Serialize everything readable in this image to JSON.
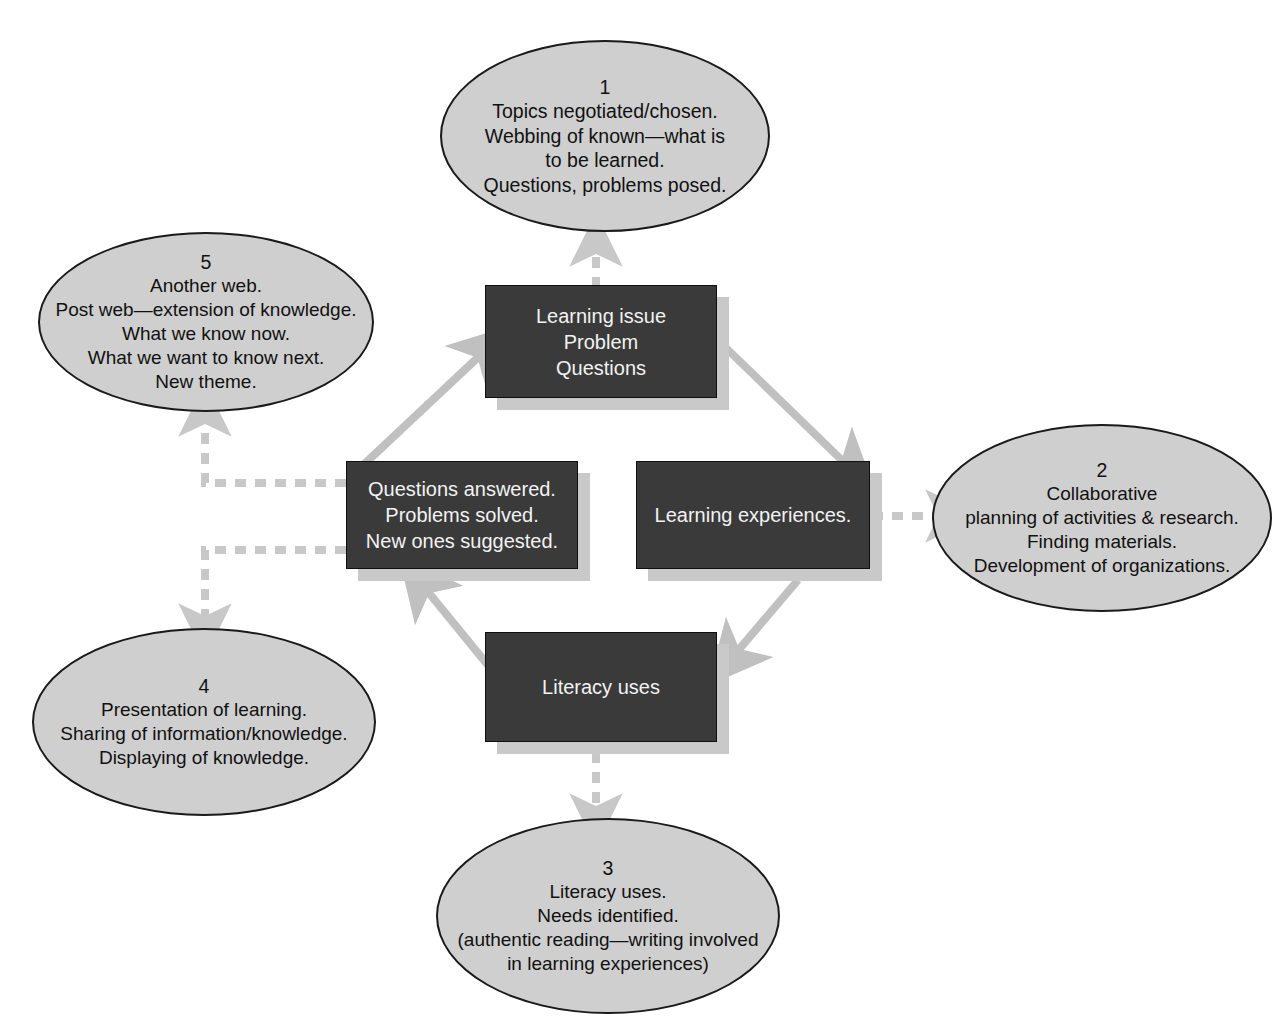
{
  "diagram": {
    "colors": {
      "background": "#ffffff",
      "ellipse_fill": "#cfcfcf",
      "ellipse_stroke": "#1a1a1a",
      "box_fill": "#3a3a3a",
      "box_text": "#f2f2f2",
      "arrow_solid": "#c0c0c0",
      "arrow_dashed": "#c8c8c8",
      "shadow": "#c9c9c9"
    },
    "ellipses": [
      {
        "id": "ellipse-1",
        "number": "1",
        "lines": [
          "Topics negotiated/chosen.",
          "Webbing of known—what is",
          "to be learned.",
          "Questions, problems posed."
        ]
      },
      {
        "id": "ellipse-2",
        "number": "2",
        "lines": [
          "Collaborative",
          "planning of activities & research.",
          "Finding materials.",
          "Development of organizations."
        ]
      },
      {
        "id": "ellipse-3",
        "number": "3",
        "lines": [
          "Literacy uses.",
          "Needs identified.",
          "(authentic reading—writing involved",
          "in learning experiences)"
        ]
      },
      {
        "id": "ellipse-4",
        "number": "4",
        "lines": [
          "Presentation of learning.",
          "Sharing of information/knowledge.",
          "Displaying of knowledge."
        ]
      },
      {
        "id": "ellipse-5",
        "number": "5",
        "lines": [
          "Another web.",
          "Post web—extension of knowledge.",
          "What we know now.",
          "What we want to know next.",
          "New theme."
        ]
      }
    ],
    "boxes": [
      {
        "id": "box-top",
        "lines": [
          "Learning issue",
          "Problem",
          "Questions"
        ]
      },
      {
        "id": "box-right",
        "lines": [
          "Learning experiences."
        ]
      },
      {
        "id": "box-bottom",
        "lines": [
          "Literacy uses"
        ]
      },
      {
        "id": "box-left",
        "lines": [
          "Questions answered.",
          "Problems solved.",
          "New ones suggested."
        ]
      }
    ],
    "connectors": [
      {
        "id": "cycle-left-to-top",
        "style": "solid",
        "from": "box-left",
        "to": "box-top"
      },
      {
        "id": "cycle-top-to-right",
        "style": "solid",
        "from": "box-top",
        "to": "box-right"
      },
      {
        "id": "cycle-right-to-bottom",
        "style": "solid",
        "from": "box-right",
        "to": "box-bottom"
      },
      {
        "id": "cycle-bottom-to-left",
        "style": "solid",
        "from": "box-bottom",
        "to": "box-left"
      },
      {
        "id": "link-top-to-e1",
        "style": "dashed",
        "from": "box-top",
        "to": "ellipse-1"
      },
      {
        "id": "link-right-to-e2",
        "style": "dashed",
        "from": "box-right",
        "to": "ellipse-2"
      },
      {
        "id": "link-bottom-to-e3",
        "style": "dashed",
        "from": "box-bottom",
        "to": "ellipse-3"
      },
      {
        "id": "link-left-to-e4",
        "style": "dashed",
        "from": "box-left",
        "to": "ellipse-4"
      },
      {
        "id": "link-left-to-e5",
        "style": "dashed",
        "from": "box-left",
        "to": "ellipse-5"
      }
    ]
  }
}
